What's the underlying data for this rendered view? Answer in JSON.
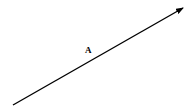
{
  "diagram": {
    "type": "vector",
    "vector": {
      "label": "A",
      "start": [
        13,
        105
      ],
      "end": [
        183,
        8
      ],
      "color": "#000000",
      "stroke_width": 1.4,
      "arrowhead": "end"
    },
    "label_position": [
      85,
      45
    ]
  }
}
